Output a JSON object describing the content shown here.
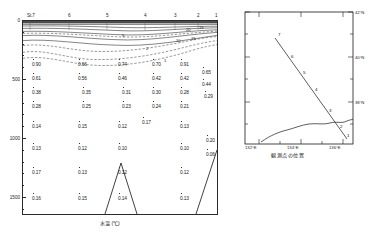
{
  "figure": {
    "type": "oceanographic-section",
    "xlabel": "水温 (℃)",
    "map_caption": "観測点の位置"
  },
  "section": {
    "stations": [
      {
        "label": "St.7",
        "x": 30
      },
      {
        "label": "6",
        "x": 69
      },
      {
        "label": "5",
        "x": 107
      },
      {
        "label": "4",
        "x": 145
      },
      {
        "label": "3",
        "x": 175
      },
      {
        "label": "2",
        "x": 198
      },
      {
        "label": "1",
        "x": 216
      }
    ],
    "depth_ticks": [
      {
        "label": "0",
        "y": 20
      },
      {
        "label": "500",
        "y": 79
      },
      {
        "label": "1000",
        "y": 138
      },
      {
        "label": "1500",
        "y": 197
      }
    ],
    "contour_labels": [
      {
        "text": "20",
        "x": 186,
        "y": 27
      },
      {
        "text": "15",
        "x": 199,
        "y": 25
      },
      {
        "text": "10",
        "x": 176,
        "y": 38
      },
      {
        "text": "15",
        "x": 191,
        "y": 36
      },
      {
        "text": "5",
        "x": 122,
        "y": 33
      },
      {
        "text": "2",
        "x": 146,
        "y": 46
      },
      {
        "text": "1",
        "x": 164,
        "y": 58
      }
    ],
    "values": [
      {
        "v": "0.90",
        "x": 32,
        "y": 62
      },
      {
        "v": "0.61",
        "x": 32,
        "y": 76
      },
      {
        "v": "0.38",
        "x": 32,
        "y": 90
      },
      {
        "v": "0.28",
        "x": 32,
        "y": 104
      },
      {
        "v": "0.14",
        "x": 32,
        "y": 124
      },
      {
        "v": "0.13",
        "x": 32,
        "y": 146
      },
      {
        "v": "0.17",
        "x": 32,
        "y": 170
      },
      {
        "v": "0.16",
        "x": 32,
        "y": 196
      },
      {
        "v": "0.66",
        "x": 78,
        "y": 62
      },
      {
        "v": "0.56",
        "x": 78,
        "y": 76
      },
      {
        "v": "0.35",
        "x": 82,
        "y": 90
      },
      {
        "v": "0.25",
        "x": 82,
        "y": 104
      },
      {
        "v": "0.15",
        "x": 78,
        "y": 124
      },
      {
        "v": "0.12",
        "x": 78,
        "y": 146
      },
      {
        "v": "0.13",
        "x": 78,
        "y": 170
      },
      {
        "v": "0.15",
        "x": 78,
        "y": 196
      },
      {
        "v": "0.74",
        "x": 118,
        "y": 62
      },
      {
        "v": "0.46",
        "x": 118,
        "y": 76
      },
      {
        "v": "0.31",
        "x": 122,
        "y": 90
      },
      {
        "v": "0.23",
        "x": 122,
        "y": 104
      },
      {
        "v": "0.12",
        "x": 118,
        "y": 124
      },
      {
        "v": "0.10",
        "x": 118,
        "y": 146
      },
      {
        "v": "0.12",
        "x": 118,
        "y": 170
      },
      {
        "v": "0.14",
        "x": 118,
        "y": 196
      },
      {
        "v": "0.17",
        "x": 142,
        "y": 120
      },
      {
        "v": "0.70",
        "x": 152,
        "y": 62
      },
      {
        "v": "0.42",
        "x": 152,
        "y": 76
      },
      {
        "v": "0.30",
        "x": 152,
        "y": 90
      },
      {
        "v": "0.24",
        "x": 152,
        "y": 104
      },
      {
        "v": "0.91",
        "x": 180,
        "y": 62
      },
      {
        "v": "0.42",
        "x": 180,
        "y": 76
      },
      {
        "v": "0.28",
        "x": 180,
        "y": 90
      },
      {
        "v": "0.21",
        "x": 180,
        "y": 104
      },
      {
        "v": "0.13",
        "x": 180,
        "y": 124
      },
      {
        "v": "0.10",
        "x": 180,
        "y": 146
      },
      {
        "v": "0.12",
        "x": 180,
        "y": 170
      },
      {
        "v": "0.13",
        "x": 180,
        "y": 196
      },
      {
        "v": "0.65",
        "x": 202,
        "y": 70
      },
      {
        "v": "0.44",
        "x": 202,
        "y": 82
      },
      {
        "v": "0.29",
        "x": 204,
        "y": 94
      },
      {
        "v": "0.20",
        "x": 206,
        "y": 138
      },
      {
        "v": "0.06",
        "x": 206,
        "y": 152
      }
    ]
  },
  "map": {
    "lat_ticks": [
      {
        "label": "42°N",
        "y": 4
      },
      {
        "label": "40°N",
        "y": 49
      },
      {
        "label": "38°N",
        "y": 94
      }
    ],
    "lon_ticks": [
      {
        "label": "132°E",
        "x": 14
      },
      {
        "label": "134°E",
        "x": 56
      },
      {
        "label": "136°E",
        "x": 98
      }
    ],
    "stations": [
      {
        "n": "7",
        "x": 45,
        "y": 28
      },
      {
        "n": "6",
        "x": 58,
        "y": 50
      },
      {
        "n": "5",
        "x": 70,
        "y": 66
      },
      {
        "n": "4",
        "x": 82,
        "y": 83
      },
      {
        "n": "3",
        "x": 96,
        "y": 104
      },
      {
        "n": "2",
        "x": 107,
        "y": 120
      },
      {
        "n": "1",
        "x": 114,
        "y": 129
      }
    ]
  }
}
